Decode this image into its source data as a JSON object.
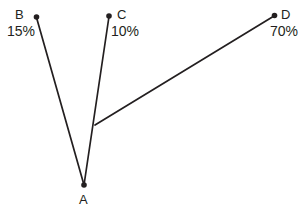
{
  "diagram": {
    "type": "node-link-tree",
    "background_color": "#ffffff",
    "stroke_color": "#231f20",
    "nodes": [
      {
        "id": "A",
        "label": "A",
        "x": 84,
        "y": 185,
        "role": "root-vertex"
      },
      {
        "id": "B",
        "label": "B",
        "x": 36,
        "y": 17,
        "role": "leaf",
        "value": "15%"
      },
      {
        "id": "C",
        "label": "C",
        "x": 109,
        "y": 16,
        "role": "leaf",
        "value": "10%"
      },
      {
        "id": "D",
        "label": "D",
        "x": 275,
        "y": 15,
        "role": "leaf",
        "value": "70%"
      }
    ],
    "junction": {
      "id": "J",
      "x": 95,
      "y": 125,
      "role": "branch-point"
    },
    "edges": [
      {
        "id": "edge-a-b",
        "from": "A",
        "to": "B"
      },
      {
        "id": "edge-a-c",
        "from": "A",
        "to": "C"
      },
      {
        "id": "edge-j-d",
        "from": "J",
        "to": "D"
      }
    ],
    "labels": {
      "a": "A",
      "b": "B",
      "c": "C",
      "d": "D"
    },
    "values": {
      "b": "15%",
      "c": "10%",
      "d": "70%"
    }
  }
}
